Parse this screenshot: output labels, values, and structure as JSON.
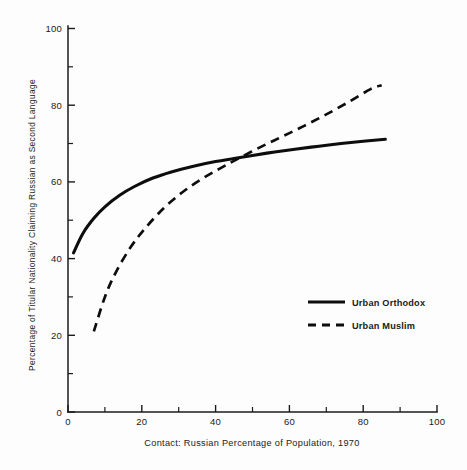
{
  "chart_data": {
    "type": "line",
    "title": "",
    "xlabel": "Contact:  Russian Percentage of Population, 1970",
    "ylabel": "Percentage of Titular Nationality Claiming Russian as Second Language",
    "xlim": [
      0,
      100
    ],
    "ylim": [
      0,
      100
    ],
    "xticks": [
      0,
      20,
      40,
      60,
      80,
      100
    ],
    "xtick_labels": [
      "0",
      "20",
      "40",
      "60",
      "80",
      "100"
    ],
    "xminor_ticks": [
      10,
      30,
      50,
      70,
      90
    ],
    "yticks": [
      0,
      20,
      40,
      60,
      80,
      100
    ],
    "ytick_labels": [
      "0",
      "20",
      "40",
      "60",
      "80",
      "100"
    ],
    "yminor_ticks": [
      10,
      30,
      50,
      70,
      90
    ],
    "grid": false,
    "legend_position": "center-right",
    "series": [
      {
        "name": "Urban Orthodox",
        "style": "solid",
        "color": "#0d0d0d",
        "x": [
          1.5,
          4,
          7,
          10,
          14,
          18,
          23,
          28,
          34,
          40,
          45,
          50,
          56,
          62,
          68,
          74,
          80,
          86
        ],
        "y": [
          41.5,
          46.5,
          50.5,
          53.5,
          56.5,
          58.8,
          61.0,
          62.6,
          64.1,
          65.3,
          66.1,
          66.9,
          67.8,
          68.6,
          69.3,
          70.0,
          70.6,
          71.1
        ]
      },
      {
        "name": "Urban Muslim",
        "style": "dashed",
        "color": "#0d0d0d",
        "x": [
          7,
          10,
          13,
          17,
          21,
          26,
          31,
          36,
          41,
          46,
          52,
          58,
          64,
          70,
          76,
          82,
          85
        ],
        "y": [
          21.0,
          30.0,
          36.5,
          43.0,
          48.0,
          53.2,
          57.3,
          60.6,
          63.4,
          66.0,
          69.0,
          71.8,
          74.6,
          77.6,
          80.8,
          84.2,
          85.2
        ]
      }
    ],
    "crossing_point": {
      "x": 42,
      "y": 65.5
    }
  },
  "legend": {
    "items": [
      {
        "label": "Urban Orthodox",
        "style": "solid"
      },
      {
        "label": "Urban Muslim",
        "style": "dashed"
      }
    ]
  },
  "colors": {
    "ink": "#1b1b1b",
    "series": "#0d0d0d",
    "background": "#fdfdfd"
  }
}
